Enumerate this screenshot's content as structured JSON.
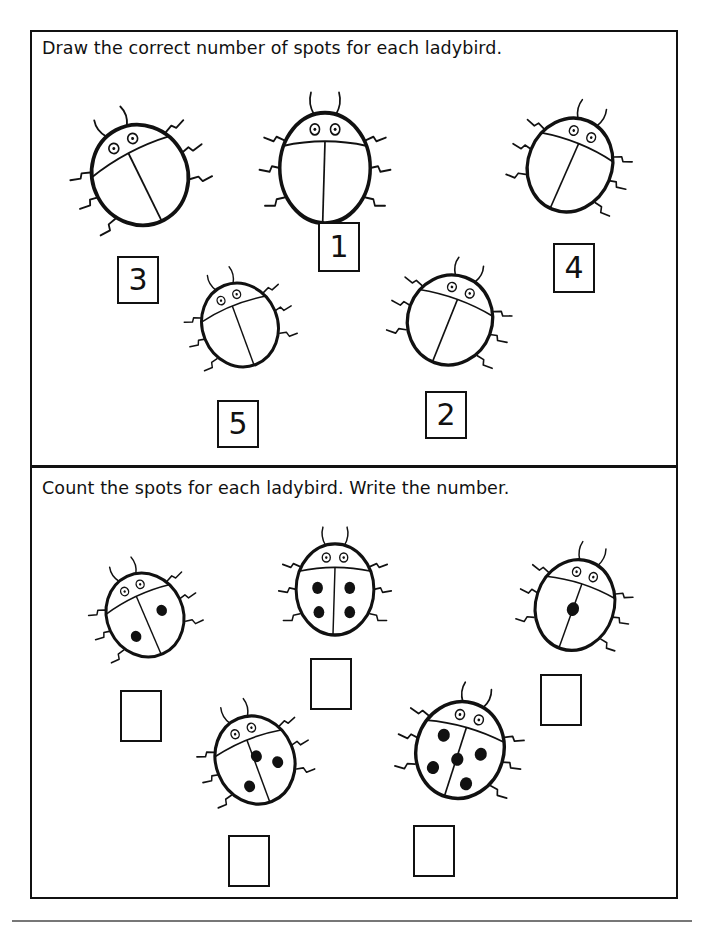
{
  "section1": {
    "instruction": "Draw the correct number of spots for each ladybird.",
    "ladybirds": [
      {
        "label": "3",
        "spots": 0
      },
      {
        "label": "1",
        "spots": 0
      },
      {
        "label": "4",
        "spots": 0
      },
      {
        "label": "5",
        "spots": 0
      },
      {
        "label": "2",
        "spots": 0
      }
    ]
  },
  "section2": {
    "instruction": "Count the spots for each ladybird. Write the number.",
    "ladybirds": [
      {
        "spots": 2,
        "answer": ""
      },
      {
        "spots": 4,
        "answer": ""
      },
      {
        "spots": 1,
        "answer": ""
      },
      {
        "spots": 3,
        "answer": ""
      },
      {
        "spots": 5,
        "answer": ""
      }
    ]
  },
  "colors": {
    "ink": "#111111",
    "paper": "#ffffff"
  }
}
